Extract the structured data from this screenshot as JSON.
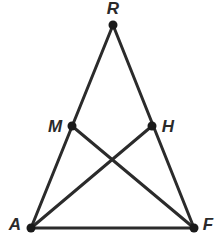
{
  "diagram": {
    "type": "geometry-figure",
    "points": [
      {
        "id": "R",
        "label": "R",
        "x": 113,
        "y": 25,
        "label_x": 113,
        "label_y": 14
      },
      {
        "id": "M",
        "label": "M",
        "x": 72,
        "y": 126,
        "label_x": 55,
        "label_y": 132
      },
      {
        "id": "H",
        "label": "H",
        "x": 152,
        "y": 126,
        "label_x": 168,
        "label_y": 132
      },
      {
        "id": "A",
        "label": "A",
        "x": 31,
        "y": 228,
        "label_x": 15,
        "label_y": 230
      },
      {
        "id": "F",
        "label": "F",
        "x": 194,
        "y": 228,
        "label_x": 208,
        "label_y": 230
      }
    ],
    "segments": [
      {
        "from": "R",
        "to": "A"
      },
      {
        "from": "R",
        "to": "F"
      },
      {
        "from": "A",
        "to": "F"
      },
      {
        "from": "M",
        "to": "F"
      },
      {
        "from": "H",
        "to": "A"
      }
    ],
    "colors": {
      "line": "#2b2b2b",
      "point": "#1a1a1a",
      "label": "#2a2a2a",
      "background": "#ffffff"
    }
  }
}
